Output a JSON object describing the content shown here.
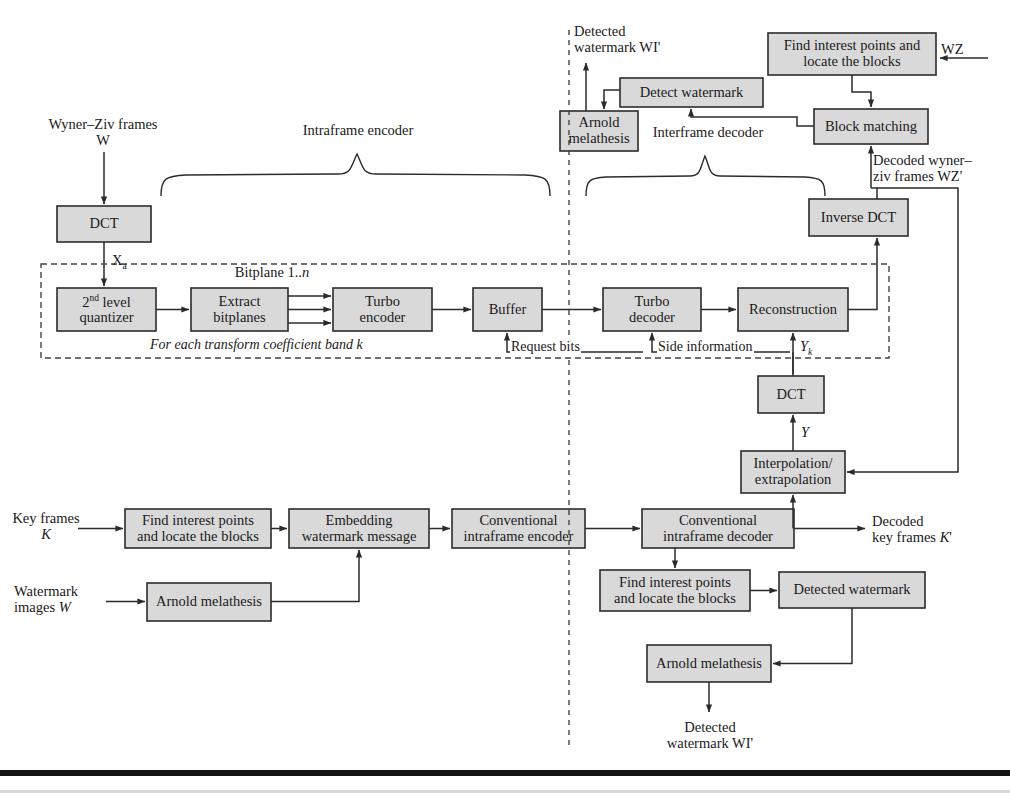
{
  "figure": {
    "type": "block-diagram",
    "box_fill": "#d9d9d9",
    "box_stroke": "#2b2b2b",
    "line_color": "#2b2b2b",
    "dashed_color": "#555555"
  },
  "blocks": [
    {
      "id": "dct_enc",
      "label": "DCT",
      "x": 57,
      "y": 206,
      "w": 94,
      "h": 36
    },
    {
      "id": "quantizer",
      "label": "2nd level\nquantizer",
      "x": 57,
      "y": 288,
      "w": 99,
      "h": 43
    },
    {
      "id": "extract_bitplanes",
      "label": "Extract\nbitplanes",
      "x": 191,
      "y": 288,
      "w": 97,
      "h": 43
    },
    {
      "id": "turbo_encoder",
      "label": "Turbo\nencoder",
      "x": 333,
      "y": 288,
      "w": 99,
      "h": 43
    },
    {
      "id": "buffer",
      "label": "Buffer",
      "x": 473,
      "y": 288,
      "w": 69,
      "h": 43
    },
    {
      "id": "turbo_decoder",
      "label": "Turbo\ndecoder",
      "x": 603,
      "y": 288,
      "w": 98,
      "h": 43
    },
    {
      "id": "reconstruction",
      "label": "Reconstruction",
      "x": 738,
      "y": 288,
      "w": 110,
      "h": 43
    },
    {
      "id": "inverse_dct",
      "label": "Inverse DCT",
      "x": 809,
      "y": 199,
      "w": 99,
      "h": 37
    },
    {
      "id": "block_matching",
      "label": "Block matching",
      "x": 814,
      "y": 109,
      "w": 114,
      "h": 35
    },
    {
      "id": "find_points_wz",
      "label": "Find interest points and\nlocate the blocks",
      "x": 768,
      "y": 33,
      "w": 168,
      "h": 42
    },
    {
      "id": "detect_watermark",
      "label": "Detect watermark",
      "x": 620,
      "y": 78,
      "w": 143,
      "h": 29
    },
    {
      "id": "arnold_top",
      "label": "Arnold\nmelathesis",
      "x": 560,
      "y": 111,
      "w": 78,
      "h": 40
    },
    {
      "id": "dct_dec",
      "label": "DCT",
      "x": 758,
      "y": 376,
      "w": 66,
      "h": 37
    },
    {
      "id": "interpolation",
      "label": "Interpolation/\nextrapolation",
      "x": 741,
      "y": 451,
      "w": 104,
      "h": 42
    },
    {
      "id": "find_points_key",
      "label": "Find interest points\nand locate the blocks",
      "x": 125,
      "y": 509,
      "w": 146,
      "h": 39
    },
    {
      "id": "embedding",
      "label": "Embedding\nwatermark message",
      "x": 289,
      "y": 509,
      "w": 140,
      "h": 39
    },
    {
      "id": "conv_intra_enc",
      "label": "Conventional\nintraframe encoder",
      "x": 452,
      "y": 509,
      "w": 133,
      "h": 39
    },
    {
      "id": "conv_intra_dec",
      "label": "Conventional\nintraframe decoder",
      "x": 642,
      "y": 509,
      "w": 152,
      "h": 39
    },
    {
      "id": "arnold_bottom_enc",
      "label": "Arnold melathesis",
      "x": 147,
      "y": 583,
      "w": 124,
      "h": 38
    },
    {
      "id": "find_points_dec",
      "label": "Find interest points\nand locate the blocks",
      "x": 600,
      "y": 570,
      "w": 150,
      "h": 41
    },
    {
      "id": "detected_watermark",
      "label": "Detected watermark",
      "x": 779,
      "y": 572,
      "w": 146,
      "h": 36
    },
    {
      "id": "arnold_bottom_dec",
      "label": "Arnold melathesis",
      "x": 647,
      "y": 645,
      "w": 124,
      "h": 37
    }
  ],
  "annotations": {
    "wyner_ziv_frames": "Wyner–Ziv frames",
    "wyner_ziv_symbol": "W",
    "x_a": "Xa",
    "bitplane": "Bitplane 1..n",
    "for_each_band": "For each transform coefficient band k",
    "request_bits": "Request bits",
    "side_information": "Side information",
    "y_k": "Yk",
    "y_label": "Y",
    "wz_input": "WZ",
    "decoded_wz_frames_line1": "Decoded wyner–",
    "decoded_wz_frames_line2": "ziv frames WZ'",
    "detected_watermark_top_line1": "Detected",
    "detected_watermark_top_line2": "watermark WI'",
    "decoded_key_frames_line1": "Decoded",
    "decoded_key_frames_line2": "key frames K'",
    "key_frames_line1": "Key frames",
    "key_frames_line2": "K",
    "watermark_images_line1": "Watermark",
    "watermark_images_line2": "images W",
    "detected_watermark_bottom_line1": "Detected",
    "detected_watermark_bottom_line2": "watermark WI'"
  },
  "braces": {
    "intraframe_encoder": "Intraframe encoder",
    "interframe_decoder": "Interframe decoder"
  }
}
